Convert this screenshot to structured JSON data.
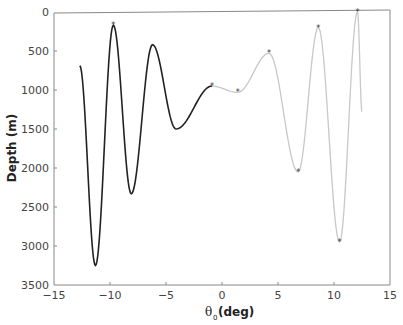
{
  "chart_data": {
    "type": "line",
    "title": "",
    "xlabel": "θ0(deg)",
    "ylabel": "Depth (m)",
    "xlim": [
      -15,
      15
    ],
    "ylim": [
      3500,
      0
    ],
    "y_inverted": true,
    "grid": false,
    "x_ticks": [
      "−15",
      "−10",
      "−5",
      "0",
      "5",
      "10",
      "15"
    ],
    "y_ticks": [
      "0",
      "500",
      "1000",
      "1500",
      "2000",
      "2500",
      "3000",
      "3500"
    ],
    "series": [
      {
        "name": "black segment",
        "color": "#222222",
        "x": [
          -12.7,
          -11.3,
          -9.7,
          -8.1,
          -6.2,
          -4.1,
          -0.9
        ],
        "y": [
          690,
          3250,
          170,
          2330,
          420,
          1500,
          950
        ]
      },
      {
        "name": "grey segment",
        "color": "#c8c8c8",
        "x": [
          -0.9,
          1.4,
          4.2,
          6.8,
          8.6,
          10.5,
          12.1,
          12.5
        ],
        "y": [
          950,
          1030,
          530,
          2050,
          200,
          2950,
          0,
          1280
        ]
      }
    ],
    "markers": [
      {
        "x": -9.7,
        "y": 170
      },
      {
        "x": -0.9,
        "y": 950
      },
      {
        "x": 1.4,
        "y": 1030
      },
      {
        "x": 4.2,
        "y": 530
      },
      {
        "x": 6.8,
        "y": 2050
      },
      {
        "x": 8.6,
        "y": 200
      },
      {
        "x": 10.5,
        "y": 2950
      },
      {
        "x": 12.1,
        "y": 0
      }
    ]
  },
  "labels": {
    "x_axis": "(deg)",
    "x_theta": "θ",
    "x_sub": "0",
    "y_axis": "Depth (m)",
    "xt0": "−15",
    "xt1": "−10",
    "xt2": "−5",
    "xt3": "0",
    "xt4": "5",
    "xt5": "10",
    "xt6": "15",
    "yt0": "0",
    "yt1": "500",
    "yt2": "1000",
    "yt3": "1500",
    "yt4": "2000",
    "yt5": "2500",
    "yt6": "3000",
    "yt7": "3500"
  }
}
